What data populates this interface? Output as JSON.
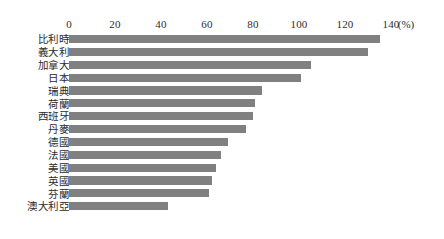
{
  "chart_data": {
    "type": "bar",
    "orientation": "horizontal",
    "title": "",
    "subtitle": "",
    "xlabel": "",
    "ylabel": "",
    "unit_label": "(%)",
    "xlim": [
      0,
      140
    ],
    "xticks": [
      0,
      20,
      40,
      60,
      80,
      100,
      120,
      140
    ],
    "xtick_labels": [
      "0",
      "20",
      "40",
      "60",
      "80",
      "100",
      "120",
      "140"
    ],
    "grid": false,
    "legend": false,
    "bar_color": "#808080",
    "categories": [
      "比利時",
      "義大利",
      "加拿大",
      "日本",
      "瑞典",
      "荷蘭",
      "西班牙",
      "丹麥",
      "德國",
      "法國",
      "美國",
      "英國",
      "芬蘭",
      "澳大利亞"
    ],
    "values": [
      135,
      130,
      105,
      101,
      84,
      81,
      80,
      77,
      69,
      66,
      64,
      62,
      61,
      43
    ]
  }
}
